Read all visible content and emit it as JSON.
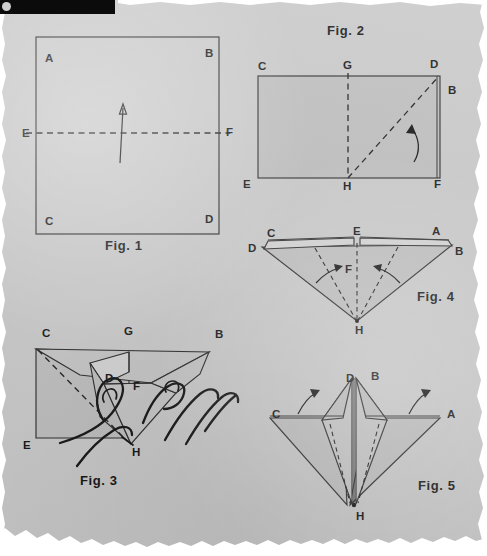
{
  "page": {
    "kind": "scanned-origami-instruction-page",
    "background_color": "#c8c8c8",
    "ink_color": "#1c1c1c",
    "paper_fill_color": "#bdbdbd",
    "width": 487,
    "height": 556
  },
  "figures": [
    {
      "id": "fig1",
      "caption": "Fig. 1",
      "description": "Square sheet with horizontal dashed fold line E-F and an upward arrow",
      "labels": [
        {
          "text": "A",
          "x": 45,
          "y": 53
        },
        {
          "text": "B",
          "x": 205,
          "y": 48
        },
        {
          "text": "C",
          "x": 45,
          "y": 216
        },
        {
          "text": "D",
          "x": 205,
          "y": 214
        },
        {
          "text": "E",
          "x": 22,
          "y": 128
        },
        {
          "text": "F",
          "x": 226,
          "y": 127
        }
      ]
    },
    {
      "id": "fig2",
      "caption": "Fig. 2",
      "description": "Folded rectangle with vertical dashed crease G-H and diagonal dashed crease H-D, curved arrow",
      "labels": [
        {
          "text": "C",
          "x": 258,
          "y": 61
        },
        {
          "text": "G",
          "x": 343,
          "y": 60
        },
        {
          "text": "D",
          "x": 430,
          "y": 59
        },
        {
          "text": "B",
          "x": 448,
          "y": 85
        },
        {
          "text": "E",
          "x": 243,
          "y": 179
        },
        {
          "text": "H",
          "x": 343,
          "y": 181
        },
        {
          "text": "F",
          "x": 434,
          "y": 179
        }
      ]
    },
    {
      "id": "fig3",
      "caption": "Fig. 3",
      "description": "Two hands pushing the corners inward to collapse the fold",
      "labels": [
        {
          "text": "C",
          "x": 42,
          "y": 328
        },
        {
          "text": "G",
          "x": 124,
          "y": 326
        },
        {
          "text": "B",
          "x": 215,
          "y": 329
        },
        {
          "text": "D",
          "x": 105,
          "y": 373
        },
        {
          "text": "F",
          "x": 133,
          "y": 381
        },
        {
          "text": "E",
          "x": 23,
          "y": 440
        },
        {
          "text": "H",
          "x": 132,
          "y": 447
        }
      ]
    },
    {
      "id": "fig4",
      "caption": "Fig. 4",
      "description": "Inverted triangle with top flaps; dashed creases folding inward toward center",
      "labels": [
        {
          "text": "C",
          "x": 267,
          "y": 228
        },
        {
          "text": "E",
          "x": 353,
          "y": 226
        },
        {
          "text": "A",
          "x": 432,
          "y": 226
        },
        {
          "text": "D",
          "x": 248,
          "y": 243
        },
        {
          "text": "B",
          "x": 455,
          "y": 246
        },
        {
          "text": "F",
          "x": 345,
          "y": 264
        },
        {
          "text": "H",
          "x": 355,
          "y": 325
        }
      ]
    },
    {
      "id": "fig5",
      "caption": "Fig. 5",
      "description": "Completed base with raised points D and B, side wings C and A, bottom point H, with lifting arrows",
      "labels": [
        {
          "text": "D",
          "x": 346,
          "y": 373
        },
        {
          "text": "B",
          "x": 371,
          "y": 371
        },
        {
          "text": "C",
          "x": 272,
          "y": 409
        },
        {
          "text": "A",
          "x": 447,
          "y": 409
        },
        {
          "text": "H",
          "x": 356,
          "y": 511
        }
      ]
    }
  ],
  "captions": {
    "fig1": {
      "text": "Fig. 1",
      "x": 105,
      "y": 239
    },
    "fig2": {
      "text": "Fig. 2",
      "x": 327,
      "y": 24
    },
    "fig3": {
      "text": "Fig. 3",
      "x": 80,
      "y": 474
    },
    "fig4": {
      "text": "Fig. 4",
      "x": 417,
      "y": 290
    },
    "fig5": {
      "text": "Fig. 5",
      "x": 418,
      "y": 479
    }
  }
}
